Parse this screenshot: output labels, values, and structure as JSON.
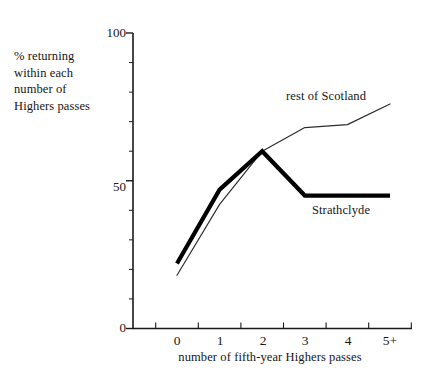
{
  "chart_data": {
    "type": "line",
    "title": "",
    "xlabel": "number of  fifth-year Highers passes",
    "ylabel": "% returning within each number of Highers passes",
    "ylabel_lines": [
      "% returning",
      "within each",
      "number of",
      "Highers passes"
    ],
    "categories": [
      "0",
      "1",
      "2",
      "3",
      "4",
      "5+"
    ],
    "ylim": [
      0,
      100
    ],
    "ytick_labels": [
      "0",
      "50",
      "100"
    ],
    "ytick_values": [
      0,
      50,
      100
    ],
    "yminor_step": 10,
    "grid": false,
    "legend_position": "inline-annotations",
    "series": [
      {
        "name": "Strathclyde",
        "style": "thick",
        "color": "#000000",
        "values": [
          22,
          47,
          60,
          45,
          45,
          45
        ],
        "label_text": "Strathclyde"
      },
      {
        "name": "rest of Scotland",
        "style": "thin",
        "color": "#2b2b2b",
        "values": [
          18,
          42,
          60,
          68,
          69,
          76
        ],
        "label_text": "rest of Scotland"
      }
    ],
    "annotations": [
      {
        "text": "rest of Scotland",
        "x": 5,
        "y": 83
      },
      {
        "text": "Strathclyde",
        "x": 3.6,
        "y": 39
      }
    ]
  },
  "axis": {
    "y_top_label": "100",
    "y_mid_label": "50",
    "y_bottom_label": "0",
    "x_labels": [
      "0",
      "1",
      "2",
      "3",
      "4",
      "5+"
    ]
  }
}
